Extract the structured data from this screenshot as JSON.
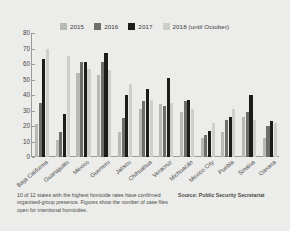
{
  "figure": {
    "background_color": "#ececeb",
    "caption": "10 of 12 states with the highest homicide rates have confirmed organised-group presence. Figures show the number of case files open for intentional homicides.",
    "source": "Source: Public Security Secretariat"
  },
  "chart_data": {
    "type": "bar",
    "title": "",
    "xlabel": "",
    "ylabel": "",
    "ylim": [
      0,
      80
    ],
    "yticks": [
      0,
      10,
      20,
      30,
      40,
      50,
      60,
      70,
      80
    ],
    "grid": false,
    "legend_position": "top",
    "categories": [
      "Baja California",
      "Guanajuato",
      "México",
      "Guerrero",
      "Jalisco",
      "Chihuahua",
      "Veracruz",
      "Michoacán",
      "Mexico City",
      "Puebla",
      "Sinaloa",
      "Oaxaca"
    ],
    "series": [
      {
        "name": "2015",
        "color": "#b9b9b4",
        "values": [
          21,
          11,
          54,
          53,
          16,
          31,
          34,
          29,
          12,
          16,
          26,
          12
        ]
      },
      {
        "name": "2016",
        "color": "#6e6e68",
        "values": [
          35,
          16,
          61,
          61,
          25,
          36,
          33,
          36,
          14,
          24,
          29,
          20
        ]
      },
      {
        "name": "2017",
        "color": "#1c1c1a",
        "values": [
          63,
          28,
          61,
          67,
          40,
          44,
          51,
          37,
          17,
          26,
          40,
          23
        ]
      },
      {
        "name": "2018 (until October)",
        "color": "#cfcfca",
        "values": [
          70,
          65,
          57,
          56,
          47,
          37,
          35,
          31,
          22,
          31,
          24,
          22
        ]
      }
    ]
  }
}
